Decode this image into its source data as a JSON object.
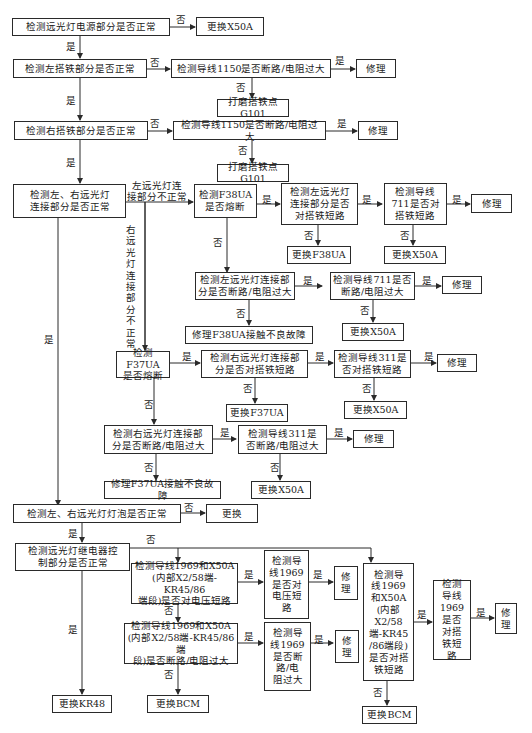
{
  "flowchart": {
    "nodes": {
      "n1": "检测远光灯电源部分是否正常",
      "n1_no": "更换X50A",
      "n2": "检测左搭铁部分是否正常",
      "n2a": "检测导线1150是否断路/电阻过大",
      "n2a_yes": "修理",
      "n2a_no": "打磨搭铁点G101",
      "n3": "检测右搭铁部分是否正常",
      "n3a": "检测导线1150是否断路/电阻过大",
      "n3a_yes": "修理",
      "n3a_no": "打磨搭铁点G101",
      "n4": "检测左、右远光灯\n连接部分是否正常",
      "f38": "检测F38UA\n是否熔断",
      "f38_yes": "检测左远光灯\n连接部分是否\n对搭铁短路",
      "f38_yes_no": "更换F38UA",
      "w711s": "检测导线\n711是否对\n搭铁短路",
      "w711s_yes": "修理",
      "w711s_no": "更换X50A",
      "f38_no": "检测左远光灯连接部\n分是否断路/电阻过大",
      "w711o": "检测导线711是否\n断路/电阻过大",
      "w711o_yes": "修理",
      "w711o_no": "更换X50A",
      "f38_fix": "修理F38UA接触不良故障",
      "f37": "检测F37UA\n是否熔断",
      "f37_yes": "检测右远光灯连接部\n分是否对搭铁短路",
      "f37_yes_no": "更换F37UA",
      "w311s": "检测导线311是\n否对搭铁短路",
      "w311s_yes": "修理",
      "w311s_no": "更换X50A",
      "f37_no": "检测右远光灯连接部\n分是否断路/电阻过大",
      "w311o": "检测导线311是\n否断路/电阻过大",
      "w311o_yes": "修理",
      "w311o_no": "更换X50A",
      "f37_fix": "修理F37UA接触不良故障",
      "n5": "检测左、右远光灯灯泡是否正常",
      "n5_no": "更换",
      "n6": "检测远光灯继电器控\n制部分是否正常",
      "n6_yes": "更换KR48",
      "v1": "检测导线1969和X50A\n(内部X2/58端-KR45/86\n端段)是否对电压短路",
      "v1_yes": "检测导\n线1969\n是否对\n电压短\n路",
      "v1_yes_yes": "修\n理",
      "o1": "检测导线1969和X50A\n(内部X2/58端-KR45/86端\n段)是否断路/电阻过大",
      "o1_yes": "检测导\n线1969\n是否断\n路/电\n阻过大",
      "o1_yes_yes": "修\n理",
      "o1_no": "更换BCM",
      "g1": "检测导\n线1969\n和X50A\n(内部X2/58\n端-KR45\n/86端段)\n是否对搭\n铁短路",
      "g1_yes": "检测\n导线\n1969\n是否\n对搭\n铁短\n路",
      "g1_yes_yes": "修\n理",
      "g1_no": "更换BCM"
    },
    "labels": {
      "yes": "是",
      "no": "否",
      "left_abnormal": "左远光灯连\n接部分不正常",
      "right_abnormal": "右远光灯连接部分不正常"
    }
  }
}
